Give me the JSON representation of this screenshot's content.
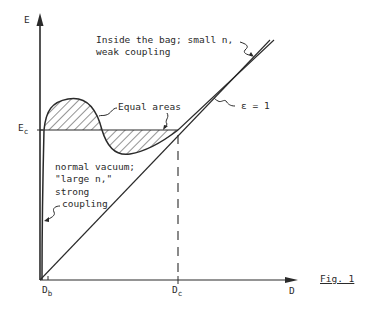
{
  "figure": {
    "caption": "Fig. 1",
    "y_axis_label": "E",
    "x_axis_label": "D",
    "ec_label_main": "E",
    "ec_label_sub": "c",
    "db_label_main": "D",
    "db_label_sub": "b",
    "dc_label_main": "D",
    "dc_label_sub": "c",
    "annotations": {
      "inside_bag_line1": "Inside the bag; small n,",
      "inside_bag_line2": "weak coupling",
      "equal_areas": "Equal areas",
      "epsilon": "ε = 1",
      "vacuum_line1": "normal vacuum;",
      "vacuum_line2": "\"large n,\"",
      "vacuum_line3": "strong",
      "vacuum_line4": "coupling"
    },
    "colors": {
      "ink": "#2a2a2a",
      "background": "#ffffff"
    }
  }
}
